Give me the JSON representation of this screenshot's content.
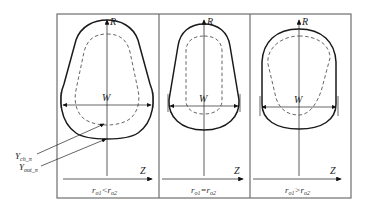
{
  "figure": {
    "panels": [
      {
        "id": "left",
        "axis_r_label": "R",
        "width_label": "W",
        "axis_z_label": "Z",
        "caption_main_a": "r",
        "caption_sub_a": "o1",
        "caption_op": "<",
        "caption_main_b": "r",
        "caption_sub_b": "o2"
      },
      {
        "id": "middle",
        "axis_r_label": "R",
        "width_label": "W",
        "axis_z_label": "Z",
        "caption_main_a": "r",
        "caption_sub_a": "o1",
        "caption_op": "=",
        "caption_main_b": "r",
        "caption_sub_b": "o2"
      },
      {
        "id": "right",
        "axis_r_label": "R",
        "width_label": "W",
        "axis_z_label": "Z",
        "caption_main_a": "r",
        "caption_sub_a": "o1",
        "caption_op": ">",
        "caption_main_b": "r",
        "caption_sub_b": "o2"
      }
    ],
    "annotations": [
      {
        "main": "Y",
        "sub": "ch_π"
      },
      {
        "main": "Y",
        "sub": "out_π"
      }
    ]
  }
}
